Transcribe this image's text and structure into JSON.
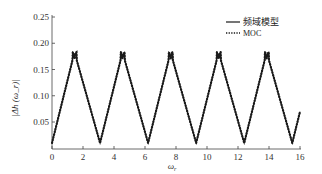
{
  "chart_data": {
    "type": "line",
    "title": "",
    "xlabel": "ω_r",
    "ylabel": "|Δh(ω_r)|",
    "xlim": [
      0,
      16
    ],
    "ylim": [
      0,
      0.25
    ],
    "xticks": [
      0,
      2,
      4,
      6,
      8,
      10,
      12,
      14,
      16
    ],
    "xtick_labels": [
      "0",
      "2",
      "4",
      "6",
      "8",
      "10",
      "12",
      "14",
      "16"
    ],
    "yticks": [
      0.05,
      0.1,
      0.15,
      0.2,
      0.25
    ],
    "ytick_labels": [
      "0.05",
      "0.10",
      "0.15",
      "0.20",
      "0.25"
    ],
    "grid": false,
    "legend_position": "upper right",
    "series": [
      {
        "name": "频域模型",
        "style": "solid",
        "x": [
          0,
          1.0,
          1.4,
          2.1,
          3.1,
          4.1,
          5.1,
          6.2,
          7.2,
          8.2,
          9.2,
          10.2,
          11.2,
          12.3,
          13.3,
          14.3,
          15.3,
          16.0
        ],
        "y": [
          0.01,
          0.175,
          0.183,
          0.01,
          0.183,
          0.01,
          0.183,
          0.01,
          0.183,
          0.01,
          0.183,
          0.01,
          0.183,
          0.01,
          0.183,
          0.01,
          0.183,
          0.01
        ]
      },
      {
        "name": "MOC",
        "style": "dotted-markers",
        "x": [
          0,
          1.0,
          1.4,
          2.1,
          3.1,
          4.1,
          5.1,
          6.2,
          7.2,
          8.2,
          9.2,
          10.2,
          11.2,
          12.3,
          13.3,
          14.3,
          15.3,
          16.0
        ],
        "y": [
          0.01,
          0.175,
          0.183,
          0.01,
          0.183,
          0.01,
          0.183,
          0.01,
          0.183,
          0.01,
          0.183,
          0.01,
          0.183,
          0.01,
          0.183,
          0.01,
          0.183,
          0.01
        ]
      }
    ],
    "peaks": [
      {
        "x": 1.4,
        "y": 0.183
      },
      {
        "x": 4.5,
        "y": 0.183
      },
      {
        "x": 7.6,
        "y": 0.183
      },
      {
        "x": 10.7,
        "y": 0.183
      },
      {
        "x": 13.8,
        "y": 0.183
      }
    ],
    "troughs": [
      {
        "x": 0,
        "y": 0.01
      },
      {
        "x": 3.1,
        "y": 0.01
      },
      {
        "x": 6.2,
        "y": 0.01
      },
      {
        "x": 9.3,
        "y": 0.01
      },
      {
        "x": 12.4,
        "y": 0.01
      },
      {
        "x": 15.5,
        "y": 0.01
      }
    ],
    "period": 3.1,
    "colors": {
      "line": "#1a1a1a",
      "axis": "#444444"
    }
  },
  "legend": {
    "items": [
      {
        "label": "频域模型",
        "style": "solid"
      },
      {
        "label": "MOC",
        "style": "dotted"
      }
    ]
  },
  "axes": {
    "xlabel": "ω",
    "xlabel_sub": "r",
    "ylabel": "|Δh (ω_r)|"
  }
}
